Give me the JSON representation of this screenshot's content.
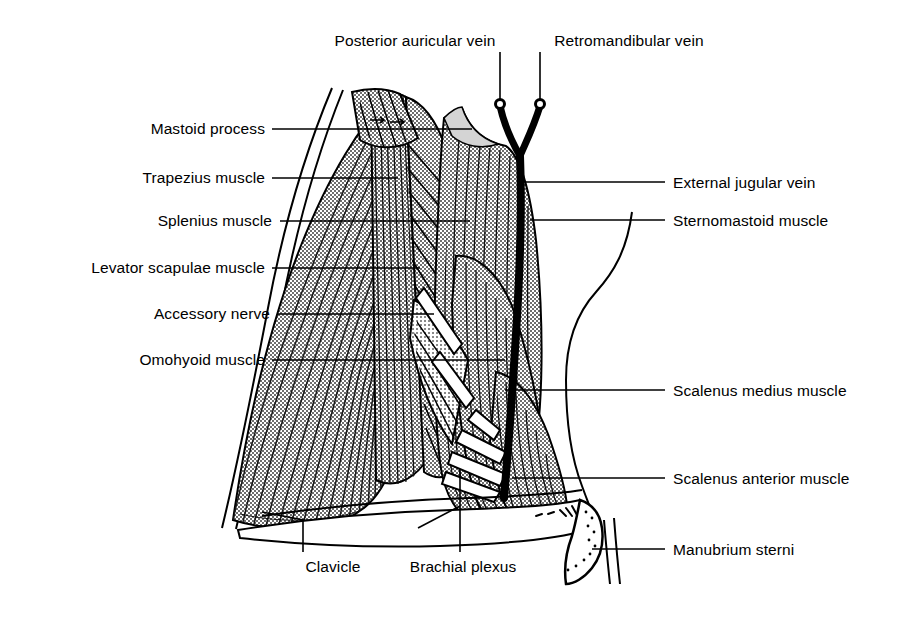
{
  "figure": {
    "kind": "anatomical-line-drawing",
    "width": 922,
    "height": 619,
    "background_color": "#ffffff",
    "ink_color": "#000000",
    "muscle_fill_color": "#b5b5b5",
    "vein_color": "#000000"
  },
  "labels": {
    "top": [
      {
        "id": "posterior-auricular-vein",
        "text": "Posterior auricular vein",
        "align": "center",
        "x": 415,
        "y": 32,
        "leader": {
          "type": "vertical",
          "x": 500,
          "y1": 52,
          "y2": 103
        }
      },
      {
        "id": "retromandibular-vein",
        "text": "Retromandibular vein",
        "align": "center",
        "x": 629,
        "y": 32,
        "leader": {
          "type": "vertical",
          "x": 540,
          "y1": 52,
          "y2": 103
        }
      }
    ],
    "left": [
      {
        "id": "mastoid-process",
        "text": "Mastoid process",
        "align": "right",
        "x": 265,
        "y": 120,
        "leader": {
          "type": "horizontal",
          "x1": 272,
          "x2": 472,
          "y": 129
        }
      },
      {
        "id": "trapezius-muscle",
        "text": "Trapezius muscle",
        "align": "right",
        "x": 265,
        "y": 169,
        "leader": {
          "type": "horizontal",
          "x1": 272,
          "x2": 398,
          "y": 178
        }
      },
      {
        "id": "splenius-muscle",
        "text": "Splenius muscle",
        "align": "right",
        "x": 265,
        "y": 212,
        "leader": {
          "type": "horizontal",
          "x1": 278,
          "x2": 470,
          "y": 221
        }
      },
      {
        "id": "levator-scapulae-muscle",
        "text": "Levator scapulae  muscle",
        "align": "right",
        "x": 265,
        "y": 259,
        "leader": {
          "type": "horizontal",
          "x1": 272,
          "x2": 420,
          "y": 268
        }
      },
      {
        "id": "accessory-nerve",
        "text": "Accessory nerve",
        "align": "right",
        "x": 265,
        "y": 305,
        "leader": {
          "type": "horizontal",
          "x1": 277,
          "x2": 434,
          "y": 314
        }
      },
      {
        "id": "omohyoid-muscle",
        "text": "Omohyoid muscle",
        "align": "right",
        "x": 265,
        "y": 351,
        "leader": {
          "type": "horizontal",
          "x1": 272,
          "x2": 505,
          "y": 360
        }
      }
    ],
    "right": [
      {
        "id": "external-jugular-vein",
        "text": "External jugular vein",
        "align": "left",
        "x": 673,
        "y": 174,
        "leader": {
          "type": "horizontal",
          "x1": 523,
          "x2": 665,
          "y": 182
        }
      },
      {
        "id": "sternomastoid-muscle",
        "text": "Sternomastoid muscle",
        "align": "left",
        "x": 673,
        "y": 212,
        "leader": {
          "type": "horizontal",
          "x1": 530,
          "x2": 665,
          "y": 220
        }
      },
      {
        "id": "scalenus-medius-muscle",
        "text": "Scalenus medius muscle",
        "align": "left",
        "x": 673,
        "y": 382,
        "leader": {
          "type": "horizontal",
          "x1": 528,
          "x2": 665,
          "y": 390
        }
      },
      {
        "id": "scalenus-anterior-muscle",
        "text": "Scalenus anterior muscle",
        "align": "left",
        "x": 673,
        "y": 470,
        "leader": {
          "type": "horizontal",
          "x1": 528,
          "x2": 665,
          "y": 478
        }
      },
      {
        "id": "manubrium-sterni",
        "text": "Manubrium sterni",
        "align": "left",
        "x": 673,
        "y": 541,
        "leader": {
          "type": "horizontal",
          "x1": 592,
          "x2": 665,
          "y": 549
        }
      }
    ],
    "bottom": [
      {
        "id": "clavicle",
        "text": "Clavicle",
        "align": "center",
        "x": 333,
        "y": 566,
        "leader": {
          "type": "polyline",
          "points": "303,556 303,520 262,513"
        }
      },
      {
        "id": "brachial-plexus",
        "text": "Brachial plexus",
        "align": "center",
        "x": 463,
        "y": 566,
        "leader": {
          "type": "polyline",
          "points": "460,556 460,470"
        }
      }
    ]
  },
  "structures": [
    {
      "id": "trapezius-muscle",
      "type": "muscle",
      "shading": "striated-fan"
    },
    {
      "id": "splenius-muscle",
      "type": "muscle",
      "shading": "vertical-striations"
    },
    {
      "id": "levator-scapulae-muscle",
      "type": "muscle",
      "shading": "oblique-striations"
    },
    {
      "id": "sternomastoid-muscle",
      "type": "muscle",
      "shading": "vertical-striations"
    },
    {
      "id": "scalenus-medius-muscle",
      "type": "muscle",
      "shading": "vertical-striations"
    },
    {
      "id": "scalenus-anterior-muscle",
      "type": "muscle",
      "shading": "vertical-striations"
    },
    {
      "id": "omohyoid-muscle",
      "type": "muscle",
      "shading": "oblique-band"
    },
    {
      "id": "external-jugular-vein",
      "type": "vein",
      "shading": "solid-black"
    },
    {
      "id": "posterior-auricular-vein",
      "type": "vein",
      "shading": "solid-black"
    },
    {
      "id": "retromandibular-vein",
      "type": "vein",
      "shading": "solid-black"
    },
    {
      "id": "accessory-nerve",
      "type": "nerve",
      "shading": "white-band"
    },
    {
      "id": "brachial-plexus",
      "type": "nerve-plexus",
      "shading": "white-bands"
    },
    {
      "id": "clavicle",
      "type": "bone",
      "shading": "outline"
    },
    {
      "id": "manubrium-sterni",
      "type": "bone",
      "shading": "outline-stipple"
    },
    {
      "id": "mastoid-process",
      "type": "bone",
      "shading": "outline"
    }
  ]
}
